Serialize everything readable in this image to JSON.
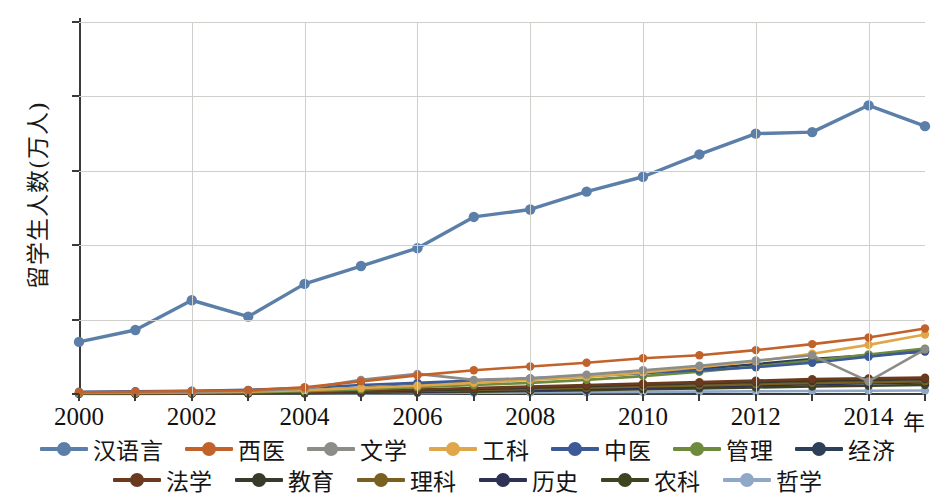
{
  "chart_data": {
    "type": "line",
    "title": "",
    "xlabel": "年",
    "ylabel": "留学生人数(万人)",
    "x": [
      2000,
      2001,
      2002,
      2003,
      2004,
      2005,
      2006,
      2007,
      2008,
      2009,
      2010,
      2011,
      2012,
      2013,
      2014,
      2015
    ],
    "xtick_labels": [
      "2000",
      "2002",
      "2004",
      "2006",
      "2008",
      "2010",
      "2012",
      "2014"
    ],
    "xtick_values": [
      2000,
      2002,
      2004,
      2006,
      2008,
      2010,
      2012,
      2014
    ],
    "ytick_labels": [
      "0",
      "5",
      "10",
      "15",
      "20",
      "25"
    ],
    "ytick_values": [
      0,
      5,
      10,
      15,
      20,
      25
    ],
    "xlim": [
      2000,
      2015
    ],
    "ylim": [
      0,
      25
    ],
    "grid": true,
    "legend_position": "bottom",
    "marker": "circle",
    "series": [
      {
        "name": "汉语言",
        "color": "#5B7FA8",
        "values": [
          3.5,
          4.3,
          6.3,
          5.2,
          7.4,
          8.6,
          9.8,
          11.9,
          12.4,
          13.6,
          14.6,
          16.1,
          17.5,
          17.6,
          19.4,
          18.0
        ]
      },
      {
        "name": "西医",
        "color": "#C2622B",
        "values": [
          0.12,
          0.15,
          0.2,
          0.25,
          0.45,
          0.85,
          1.25,
          1.6,
          1.85,
          2.1,
          2.4,
          2.6,
          2.95,
          3.35,
          3.8,
          4.4
        ]
      },
      {
        "name": "文学",
        "color": "#8C8C88",
        "values": [
          0.1,
          0.12,
          0.15,
          0.2,
          0.35,
          0.95,
          1.35,
          0.95,
          1.05,
          1.3,
          1.6,
          1.9,
          2.25,
          2.6,
          0.85,
          3.0
        ]
      },
      {
        "name": "工科",
        "color": "#E0A74A",
        "values": [
          0.08,
          0.1,
          0.12,
          0.16,
          0.25,
          0.4,
          0.55,
          0.75,
          0.95,
          1.15,
          1.45,
          1.8,
          2.2,
          2.7,
          3.3,
          4.0
        ]
      },
      {
        "name": "中医",
        "color": "#3B5A96",
        "values": [
          0.15,
          0.18,
          0.22,
          0.28,
          0.4,
          0.6,
          0.75,
          0.9,
          1.05,
          1.2,
          1.4,
          1.6,
          1.8,
          2.1,
          2.5,
          2.9
        ]
      },
      {
        "name": "管理",
        "color": "#6E8B3D",
        "values": [
          0.05,
          0.07,
          0.09,
          0.12,
          0.18,
          0.3,
          0.45,
          0.6,
          0.75,
          0.95,
          1.2,
          1.5,
          1.85,
          2.25,
          2.65,
          3.05
        ]
      },
      {
        "name": "经济",
        "color": "#2E4057",
        "values": [
          0.07,
          0.09,
          0.12,
          0.16,
          0.24,
          0.4,
          0.6,
          0.8,
          1.0,
          1.2,
          1.45,
          1.7,
          2.0,
          2.35,
          2.6,
          2.85
        ]
      },
      {
        "name": "法学",
        "color": "#6B3A1E",
        "values": [
          0.04,
          0.05,
          0.06,
          0.08,
          0.12,
          0.2,
          0.3,
          0.4,
          0.5,
          0.6,
          0.7,
          0.8,
          0.9,
          1.0,
          1.05,
          1.1
        ]
      },
      {
        "name": "教育",
        "color": "#3A3A2A",
        "values": [
          0.03,
          0.04,
          0.05,
          0.07,
          0.1,
          0.16,
          0.24,
          0.32,
          0.42,
          0.52,
          0.62,
          0.72,
          0.8,
          0.88,
          0.95,
          1.0
        ]
      },
      {
        "name": "理科",
        "color": "#7A6020",
        "values": [
          0.03,
          0.04,
          0.05,
          0.06,
          0.09,
          0.14,
          0.2,
          0.27,
          0.34,
          0.42,
          0.5,
          0.58,
          0.66,
          0.74,
          0.8,
          0.86
        ]
      },
      {
        "name": "历史",
        "color": "#2E3154",
        "values": [
          0.02,
          0.03,
          0.04,
          0.05,
          0.07,
          0.11,
          0.16,
          0.22,
          0.28,
          0.35,
          0.42,
          0.5,
          0.58,
          0.66,
          0.72,
          0.78
        ]
      },
      {
        "name": "农科",
        "color": "#3F4420",
        "values": [
          0.02,
          0.02,
          0.03,
          0.04,
          0.05,
          0.08,
          0.12,
          0.16,
          0.21,
          0.26,
          0.32,
          0.38,
          0.44,
          0.5,
          0.55,
          0.6
        ]
      },
      {
        "name": "哲学",
        "color": "#8FA8C8",
        "values": [
          0.01,
          0.01,
          0.02,
          0.02,
          0.03,
          0.04,
          0.06,
          0.08,
          0.1,
          0.12,
          0.14,
          0.16,
          0.18,
          0.2,
          0.22,
          0.24
        ]
      }
    ]
  },
  "legend_rows": [
    [
      "汉语言",
      "西医",
      "文学",
      "工科",
      "中医",
      "管理",
      "经济"
    ],
    [
      "法学",
      "教育",
      "理科",
      "历史",
      "农科",
      "哲学"
    ]
  ]
}
